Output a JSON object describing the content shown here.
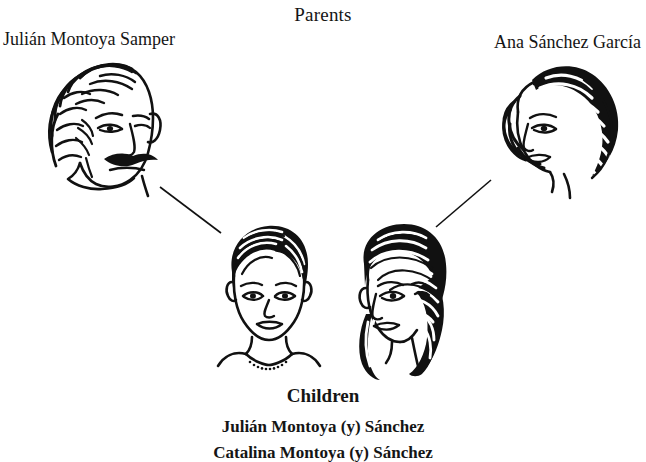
{
  "diagram": {
    "type": "family-tree",
    "background_color": "#ffffff",
    "ink_color": "#111111"
  },
  "parents": {
    "heading": "Parents",
    "father": {
      "name": "Julián Montoya Samper",
      "portrait_alt": "father-portrait"
    },
    "mother": {
      "name": "Ana Sánchez García",
      "portrait_alt": "mother-portrait"
    }
  },
  "children": {
    "heading": "Children",
    "list": [
      {
        "name": "Julián Montoya (y) Sánchez",
        "portrait_alt": "son-portrait"
      },
      {
        "name": "Catalina Montoya (y) Sánchez",
        "portrait_alt": "daughter-portrait"
      }
    ]
  },
  "connectors": [
    {
      "name": "father-to-son-line",
      "from": "father",
      "to": "son"
    },
    {
      "name": "mother-to-daughter-line",
      "from": "mother",
      "to": "daughter"
    }
  ]
}
